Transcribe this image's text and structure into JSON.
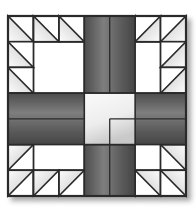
{
  "canvas": {
    "width": 196,
    "height": 210,
    "background_color": "#ffffff"
  },
  "block": {
    "title": "Quilt Block",
    "pattern_name": "Hole in the Barn Door",
    "x": 8,
    "y": 16,
    "width": 178,
    "height": 180,
    "grid_columns": 7,
    "grid_rows": 7,
    "cell_width": 25.428,
    "cell_height": 25.714,
    "border_color": "#222222",
    "border_width": 1.6,
    "background_color": "#ffffff"
  },
  "colors": {
    "triangle_light": "#fbfbfb",
    "triangle_mid": "#d8d8d8",
    "triangle_dark": "#a0a0a0",
    "cross_light": "#7d7d7d",
    "cross_dark": "#4a4a4a",
    "center_light": "#f2f2f2",
    "center_dark": "#c4c4c4",
    "outline": "#2a2a2a",
    "background": "#ffffff",
    "shadow": "#b9b9b9"
  },
  "shadow": {
    "enabled": true,
    "offset_x": 5,
    "offset_y": 5,
    "blur": 5,
    "color": "#b0b0b0"
  },
  "cross": {
    "name": "center-cross",
    "vertical_arm": {
      "col_start": 3,
      "col_end": 5,
      "row_start": 0,
      "row_end": 7
    },
    "horizontal_arm": {
      "col_start": 0,
      "col_end": 7,
      "row_start": 3,
      "row_end": 5
    },
    "center_square": {
      "col_start": 3,
      "col_end": 5,
      "row_start": 3,
      "row_end": 5
    },
    "fill": "dark-gray-gradient",
    "center_fill": "light-gray-gradient"
  },
  "quadrants": [
    {
      "name": "top-left",
      "col_start": 0,
      "row_start": 0,
      "cols": 3,
      "rows": 3,
      "triangles": [
        {
          "col": 0,
          "row": 0,
          "orientation": "lower-left"
        },
        {
          "col": 1,
          "row": 0,
          "orientation": "lower-left"
        },
        {
          "col": 2,
          "row": 0,
          "orientation": "lower-left"
        },
        {
          "col": 0,
          "row": 1,
          "orientation": "lower-left"
        },
        {
          "col": 0,
          "row": 2,
          "orientation": "lower-left"
        }
      ],
      "white_cells": [
        {
          "col": 1,
          "row": 1
        },
        {
          "col": 2,
          "row": 1
        },
        {
          "col": 1,
          "row": 2
        },
        {
          "col": 2,
          "row": 2
        }
      ]
    },
    {
      "name": "top-right",
      "col_start": 4,
      "row_start": 0,
      "cols": 3,
      "rows": 3,
      "triangles": [
        {
          "col": 0,
          "row": 0,
          "orientation": "lower-right"
        },
        {
          "col": 1,
          "row": 0,
          "orientation": "lower-right"
        },
        {
          "col": 2,
          "row": 0,
          "orientation": "lower-right"
        },
        {
          "col": 2,
          "row": 1,
          "orientation": "lower-right"
        },
        {
          "col": 2,
          "row": 2,
          "orientation": "lower-right"
        }
      ],
      "white_cells": [
        {
          "col": 0,
          "row": 1
        },
        {
          "col": 1,
          "row": 1
        },
        {
          "col": 0,
          "row": 2
        },
        {
          "col": 1,
          "row": 2
        }
      ]
    },
    {
      "name": "bottom-left",
      "col_start": 0,
      "row_start": 4,
      "cols": 3,
      "rows": 3,
      "triangles": [
        {
          "col": 0,
          "row": 0,
          "orientation": "upper-left"
        },
        {
          "col": 0,
          "row": 1,
          "orientation": "upper-left"
        },
        {
          "col": 0,
          "row": 2,
          "orientation": "upper-left"
        },
        {
          "col": 1,
          "row": 2,
          "orientation": "upper-left"
        },
        {
          "col": 2,
          "row": 2,
          "orientation": "upper-left"
        }
      ],
      "white_cells": [
        {
          "col": 1,
          "row": 0
        },
        {
          "col": 2,
          "row": 0
        },
        {
          "col": 1,
          "row": 1
        },
        {
          "col": 2,
          "row": 1
        }
      ]
    },
    {
      "name": "bottom-right",
      "col_start": 4,
      "row_start": 4,
      "cols": 3,
      "rows": 3,
      "triangles": [
        {
          "col": 2,
          "row": 0,
          "orientation": "upper-right"
        },
        {
          "col": 2,
          "row": 1,
          "orientation": "upper-right"
        },
        {
          "col": 0,
          "row": 2,
          "orientation": "upper-right"
        },
        {
          "col": 1,
          "row": 2,
          "orientation": "upper-right"
        },
        {
          "col": 2,
          "row": 2,
          "orientation": "upper-right"
        }
      ],
      "white_cells": [
        {
          "col": 0,
          "row": 0
        },
        {
          "col": 1,
          "row": 0
        },
        {
          "col": 0,
          "row": 1
        },
        {
          "col": 1,
          "row": 1
        }
      ]
    }
  ]
}
